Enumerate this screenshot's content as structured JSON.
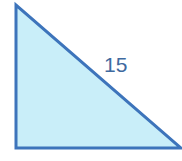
{
  "diagram": {
    "shape": "right-triangle",
    "vertices": [
      [
        16,
        5
      ],
      [
        16,
        148
      ],
      [
        181,
        148
      ]
    ],
    "right_angle_at": "bottom-left",
    "fill_color": "#c9eef9",
    "stroke_color": "#3d74bb",
    "stroke_width": 3,
    "hypotenuse_label": "15",
    "label_color": "#3f6aa0"
  }
}
